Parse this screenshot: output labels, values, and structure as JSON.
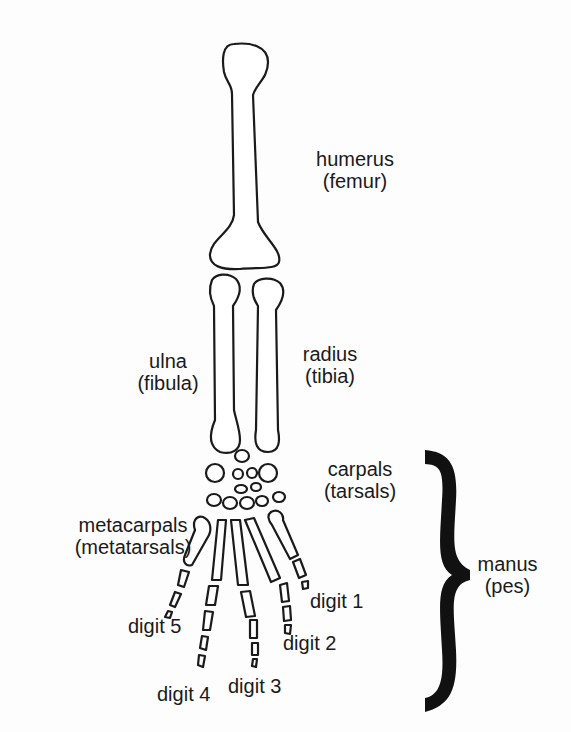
{
  "diagram": {
    "labels": {
      "humerus": {
        "name": "humerus",
        "alt": "(femur)"
      },
      "ulna": {
        "name": "ulna",
        "alt": "(fibula)"
      },
      "radius": {
        "name": "radius",
        "alt": "(tibia)"
      },
      "carpals": {
        "name": "carpals",
        "alt": "(tarsals)"
      },
      "metacarpals": {
        "name": "metacarpals",
        "alt": "(metatarsals)"
      },
      "manus": {
        "name": "manus",
        "alt": "(pes)"
      },
      "digit1": "digit 1",
      "digit2": "digit 2",
      "digit3": "digit 3",
      "digit4": "digit 4",
      "digit5": "digit 5"
    },
    "colors": {
      "line": "#1a1a1a",
      "background": "#fdfdfd",
      "bone_fill": "#ffffff"
    }
  }
}
